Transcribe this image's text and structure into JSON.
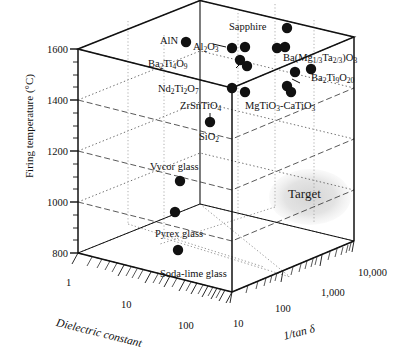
{
  "chart_data": {
    "type": "scatter",
    "title": "",
    "projection": "3d-cube",
    "xlabel": "Dielectric constant",
    "ylabel": "Firing temperature (°C)",
    "zlabel": "1/tan δ",
    "x_ticks": [
      "1",
      "10",
      "100"
    ],
    "y_ticks": [
      "800",
      "1000",
      "1200",
      "1400",
      "1600"
    ],
    "z_ticks": [
      "10",
      "100",
      "1,000",
      "10,000"
    ],
    "xlim_log": [
      1,
      100
    ],
    "ylim": [
      700,
      1700
    ],
    "zlim_log": [
      10,
      10000
    ],
    "grid": true,
    "legend": "none",
    "annotations": [
      {
        "text": "Target",
        "kind": "region-ellipse",
        "color": "#d8d8d8"
      }
    ],
    "points": [
      {
        "label": "Sapphire",
        "px": 287,
        "py": 28,
        "dielectric_constant": 9.4,
        "firing_temperature": 1700,
        "inv_tan_delta": 8000
      },
      {
        "label": "AlN",
        "px": 186,
        "py": 42,
        "dielectric_constant": 8.8,
        "firing_temperature": 1650,
        "inv_tan_delta": 1200
      },
      {
        "label": "Al2O3",
        "px": 232,
        "py": 48,
        "dielectric_constant": 9.8,
        "firing_temperature": 1620,
        "inv_tan_delta": 2500
      },
      {
        "label": "Al2O3",
        "px": 245,
        "py": 47,
        "dielectric_constant": 10.0,
        "firing_temperature": 1625,
        "inv_tan_delta": 3000
      },
      {
        "label": "Al2O3",
        "px": 277,
        "py": 48,
        "dielectric_constant": 10.2,
        "firing_temperature": 1620,
        "inv_tan_delta": 5000
      },
      {
        "label": "Al2O3",
        "px": 285,
        "py": 47,
        "dielectric_constant": 10.4,
        "firing_temperature": 1625,
        "inv_tan_delta": 5600
      },
      {
        "label": "Ba2Ti4O9",
        "px": 240,
        "py": 60,
        "dielectric_constant": 37,
        "firing_temperature": 1580,
        "inv_tan_delta": 3000
      },
      {
        "label": "Ba2Ti4O9",
        "px": 247,
        "py": 66,
        "dielectric_constant": 38,
        "firing_temperature": 1560,
        "inv_tan_delta": 3200
      },
      {
        "label": "Ba(Mg1/3Ta2/3)O3",
        "px": 295,
        "py": 72,
        "dielectric_constant": 25,
        "firing_temperature": 1540,
        "inv_tan_delta": 6000
      },
      {
        "label": "Ba(Mg1/3Ta2/3)O3",
        "px": 311,
        "py": 69,
        "dielectric_constant": 25,
        "firing_temperature": 1550,
        "inv_tan_delta": 7000
      },
      {
        "label": "Nd2Ti2O7",
        "px": 232,
        "py": 88,
        "dielectric_constant": 36,
        "firing_temperature": 1480,
        "inv_tan_delta": 1800
      },
      {
        "label": "Nd2Ti2O7",
        "px": 245,
        "py": 92,
        "dielectric_constant": 38,
        "firing_temperature": 1465,
        "inv_tan_delta": 2000
      },
      {
        "label": "Ba2Ti9O20",
        "px": 287,
        "py": 86,
        "dielectric_constant": 39,
        "firing_temperature": 1480,
        "inv_tan_delta": 5000
      },
      {
        "label": "MgTiO3-CaTiO3",
        "px": 291,
        "py": 92,
        "dielectric_constant": 21,
        "firing_temperature": 1460,
        "inv_tan_delta": 5200
      },
      {
        "label": "ZrSnTiO4",
        "px": 210,
        "py": 122,
        "dielectric_constant": 38,
        "firing_temperature": 1380,
        "inv_tan_delta": 1500
      },
      {
        "label": "Vycor glass",
        "px": 180,
        "py": 181,
        "dielectric_constant": 3.8,
        "firing_temperature": 1100,
        "inv_tan_delta": 300
      },
      {
        "label": "Pyrex glass",
        "px": 175,
        "py": 212,
        "dielectric_constant": 4.6,
        "firing_temperature": 950,
        "inv_tan_delta": 200
      },
      {
        "label": "Soda-lime glass",
        "px": 178,
        "py": 250,
        "dielectric_constant": 7.2,
        "firing_temperature": 820,
        "inv_tan_delta": 60
      }
    ],
    "point_labels": [
      {
        "id": "sapphire",
        "text": "Sapphire",
        "html": "Sapphire",
        "x": 229,
        "y": 21
      },
      {
        "id": "aln",
        "text": "AlN",
        "html": "AlN",
        "x": 160,
        "y": 35
      },
      {
        "id": "al2o3",
        "text": "Al2O3",
        "html": "Al<sub>2</sub>O<sub>3</sub>",
        "x": 193,
        "y": 41
      },
      {
        "id": "ba2ti4o9",
        "text": "Ba2Ti4O9",
        "html": "Ba<sub>2</sub>Ti<sub>4</sub>O<sub>9</sub>",
        "x": 148,
        "y": 58
      },
      {
        "id": "bamgta",
        "text": "Ba(Mg1/3Ta2/3)O3",
        "html": "Ba(Mg<sub>1/3</sub>Ta<sub>2/3</sub>)O<sub>3</sub>",
        "x": 283,
        "y": 52
      },
      {
        "id": "nd2ti2o7",
        "text": "Nd2Ti2O7",
        "html": "Nd<sub>2</sub>Ti<sub>2</sub>O<sub>7</sub>",
        "x": 158,
        "y": 83
      },
      {
        "id": "ba2ti9o20",
        "text": "Ba2Ti9O20",
        "html": "Ba<sub>2</sub>Ti<sub>9</sub>O<sub>20</sub>",
        "x": 311,
        "y": 72
      },
      {
        "id": "zrsntio4",
        "text": "ZrSnTiO4",
        "html": "ZrSnTiO<sub>4</sub>",
        "x": 180,
        "y": 100
      },
      {
        "id": "mgtio3",
        "text": "MgTiO3-CaTiO3",
        "html": "MgTiO<sub>3</sub>-CaTiO<sub>3</sub>",
        "x": 245,
        "y": 100
      },
      {
        "id": "sio2",
        "text": "SiO2",
        "html": "SiO<sub>2</sub>",
        "x": 199,
        "y": 131
      },
      {
        "id": "vycor",
        "text": "Vycor glass",
        "html": "Vycor glass",
        "x": 150,
        "y": 161
      },
      {
        "id": "pyrex",
        "text": "Pyrex glass",
        "html": "Pyrex glass",
        "x": 155,
        "y": 228
      },
      {
        "id": "sodalime",
        "text": "Soda-lime glass",
        "html": "Soda-lime glass",
        "x": 160,
        "y": 268
      }
    ]
  },
  "axes": {
    "y": {
      "label": "Firing temperature (°C)",
      "ticks": [
        {
          "value": "1600",
          "x": 36,
          "y": 44
        },
        {
          "value": "1400",
          "x": 36,
          "y": 95
        },
        {
          "value": "1200",
          "x": 36,
          "y": 146
        },
        {
          "value": "1000",
          "x": 36,
          "y": 197
        },
        {
          "value": "800",
          "x": 36,
          "y": 248
        }
      ]
    },
    "x": {
      "label": "Dielectric constant",
      "ticks": [
        {
          "value": "1",
          "x": 71,
          "y": 282
        },
        {
          "value": "10",
          "x": 128,
          "y": 303
        },
        {
          "value": "100",
          "x": 186,
          "y": 324
        }
      ]
    },
    "z": {
      "label": "1/tan δ",
      "ticks": [
        {
          "value": "10",
          "x": 240,
          "y": 322
        },
        {
          "value": "100",
          "x": 283,
          "y": 308
        },
        {
          "value": "1,000",
          "x": 330,
          "y": 292
        },
        {
          "value": "10,000",
          "x": 364,
          "y": 272
        }
      ]
    }
  },
  "target": {
    "label": "Target",
    "x": 288,
    "y": 193,
    "ellipse_cx": 310,
    "ellipse_cy": 197,
    "ellipse_rx": 40,
    "ellipse_ry": 27,
    "color": "#dcdcdc"
  },
  "colors": {
    "marker": "#111111",
    "frame": "#111111",
    "grid_dashed": "#333333",
    "grid_dotted": "#555555",
    "target_fill": "#dcdcdc",
    "background": "#ffffff"
  }
}
